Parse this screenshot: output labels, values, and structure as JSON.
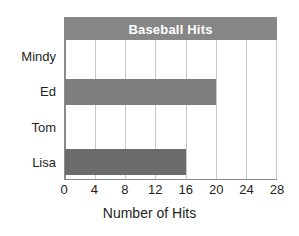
{
  "chart_data": {
    "type": "bar",
    "orientation": "horizontal",
    "title": "Baseball Hits",
    "xlabel": "Number of Hits",
    "ylabel": "",
    "categories": [
      "Mindy",
      "Ed",
      "Tom",
      "Lisa"
    ],
    "values": [
      0,
      20,
      0,
      16
    ],
    "xlim": [
      0,
      28
    ],
    "xticks": [
      0,
      4,
      8,
      12,
      16,
      20,
      24,
      28
    ],
    "xtick_labels": [
      "0",
      "4",
      "8",
      "12",
      "16",
      "20",
      "24",
      "28"
    ],
    "grid": "vertical",
    "legend": "none",
    "bar_colors": [
      "#7d7d7d",
      "#7d7d7d",
      "#6b6b6b",
      "#6b6b6b"
    ],
    "series": [
      {
        "name": "Hits",
        "points": [
          {
            "category": "Mindy",
            "value": 0,
            "color": "#7d7d7d"
          },
          {
            "category": "Ed",
            "value": 20,
            "color": "#7d7d7d"
          },
          {
            "category": "Tom",
            "value": 0,
            "color": "#6b6b6b"
          },
          {
            "category": "Lisa",
            "value": 16,
            "color": "#6b6b6b"
          }
        ]
      }
    ]
  },
  "style": {
    "title_banner_color": "#878787",
    "title_text_color": "#ffffff",
    "gridline_color": "#c9c9c9",
    "axis_color": "#8a8a8a",
    "plot_background": "#ffffff",
    "text_color": "#231f20"
  }
}
